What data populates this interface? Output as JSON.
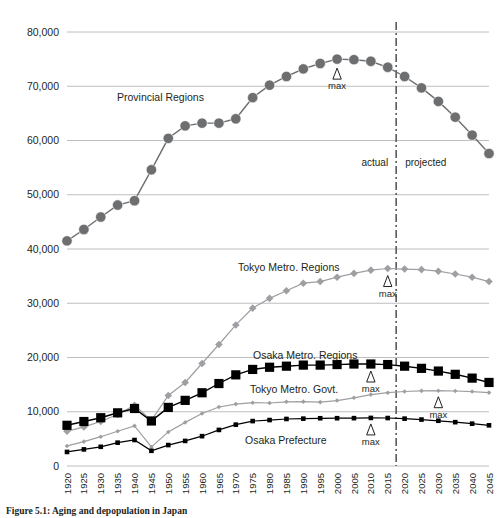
{
  "caption": "Figure 5.1: Aging and depopulation in Japan",
  "annotations": {
    "actual": "actual",
    "projected": "projected",
    "max": "max",
    "triangle_glyph": "△"
  },
  "colors": {
    "provincial": "#6d6e70",
    "tokyo_regions": "#9d9fa2",
    "osaka_regions": "#000000",
    "tokyo_govt": "#9d9fa2",
    "osaka_pref": "#000000",
    "grid": "#bcbec0",
    "divider": "#58595b"
  },
  "chart_data": {
    "type": "line",
    "title": "",
    "xlabel": "",
    "ylabel": "",
    "ylim": [
      0,
      80000
    ],
    "grid": true,
    "legend": "inline-labels",
    "divider_between": [
      "2015",
      "2020"
    ],
    "categories": [
      "1920",
      "1925",
      "1930",
      "1935",
      "1940",
      "1945",
      "1950",
      "1955",
      "1960",
      "1965",
      "1970",
      "1975",
      "1980",
      "1985",
      "1990",
      "1995",
      "2000",
      "2005",
      "2010",
      "2015",
      "2020",
      "2025",
      "2030",
      "2035",
      "2040",
      "2045"
    ],
    "yticks": [
      "0",
      "10,000",
      "20,000",
      "30,000",
      "40,000",
      "50,000",
      "60,000",
      "70,000",
      "80,000"
    ],
    "series": [
      {
        "name": "Provincial Regions",
        "marker": "circle",
        "marker_size": "large",
        "color": "#6d6e70",
        "max_year": "2000",
        "values": [
          41500,
          43600,
          45900,
          48100,
          48900,
          54600,
          60400,
          62700,
          63200,
          63200,
          64000,
          67900,
          70200,
          71800,
          73200,
          74200,
          75000,
          74900,
          74600,
          73500,
          71800,
          69700,
          67200,
          64300,
          61000,
          57600
        ]
      },
      {
        "name": "Tokyo Metro. Regions",
        "marker": "diamond",
        "marker_size": "medium",
        "color": "#9d9fa2",
        "max_year": "2015",
        "values": [
          6400,
          7200,
          8200,
          9500,
          11200,
          8400,
          13000,
          15400,
          18900,
          22400,
          26000,
          29100,
          30900,
          32300,
          33700,
          34000,
          34800,
          35500,
          36100,
          36400,
          36300,
          36200,
          35900,
          35400,
          34800,
          34000
        ]
      },
      {
        "name": "Osaka Metro. Regions",
        "marker": "square",
        "marker_size": "large",
        "color": "#000000",
        "max_year": "2010",
        "values": [
          7500,
          8200,
          8900,
          9800,
          10600,
          8300,
          10800,
          12100,
          13500,
          15200,
          16800,
          17800,
          18200,
          18400,
          18600,
          18600,
          18700,
          18800,
          18800,
          18700,
          18400,
          18000,
          17500,
          16900,
          16200,
          15400
        ]
      },
      {
        "name": "Tokyo Metro. Govt.",
        "marker": "diamond",
        "marker_size": "small",
        "color": "#9d9fa2",
        "max_year": "2030",
        "values": [
          3700,
          4500,
          5400,
          6400,
          7400,
          3500,
          6280,
          8040,
          9680,
          10870,
          11410,
          11670,
          11620,
          11830,
          11860,
          11770,
          12060,
          12580,
          13160,
          13510,
          13730,
          13850,
          13880,
          13830,
          13720,
          13530
        ]
      },
      {
        "name": "Osaka Prefecture",
        "marker": "square",
        "marker_size": "small",
        "color": "#000000",
        "max_year": "2010",
        "values": [
          2590,
          3060,
          3540,
          4300,
          4790,
          2800,
          3860,
          4620,
          5500,
          6650,
          7620,
          8280,
          8470,
          8670,
          8730,
          8800,
          8810,
          8820,
          8860,
          8840,
          8730,
          8560,
          8340,
          8080,
          7800,
          7500
        ]
      }
    ]
  }
}
